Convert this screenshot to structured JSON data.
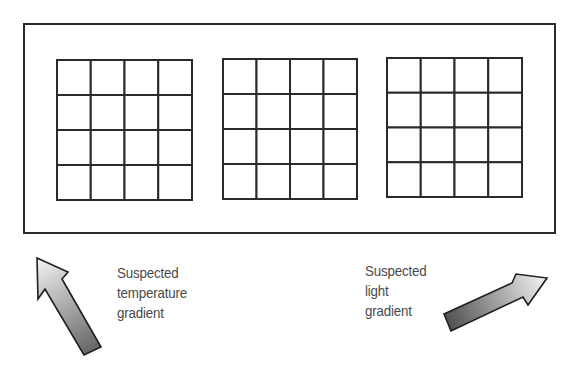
{
  "diagram": {
    "type": "plate-layout",
    "outer_frame": {
      "x": 24,
      "y": 24,
      "width": 531,
      "height": 209
    },
    "plates": [
      {
        "id": "plate-1",
        "x": 57,
        "y": 60,
        "width": 135,
        "height": 140,
        "rows": 4,
        "cols": 4
      },
      {
        "id": "plate-2",
        "x": 223,
        "y": 59,
        "width": 134,
        "height": 140,
        "rows": 4,
        "cols": 4
      },
      {
        "id": "plate-3",
        "x": 387,
        "y": 58,
        "width": 135,
        "height": 139,
        "rows": 4,
        "cols": 4
      }
    ],
    "stroke_color": "#2a2a2a",
    "arrows": [
      {
        "id": "temperature-arrow",
        "direction": "up-left",
        "points": [
          [
            37,
            258
          ],
          [
            68,
            272
          ],
          [
            62,
            279
          ],
          [
            101,
            347
          ],
          [
            84,
            355
          ],
          [
            45,
            289
          ],
          [
            38,
            299
          ]
        ],
        "gradient_start": "#f2f2f2",
        "gradient_end": "#6a6a6a"
      },
      {
        "id": "light-arrow",
        "direction": "up-right",
        "points": [
          [
            444,
            314
          ],
          [
            512,
            283
          ],
          [
            516,
            274
          ],
          [
            547,
            278
          ],
          [
            528,
            305
          ],
          [
            523,
            297
          ],
          [
            451,
            331
          ]
        ],
        "gradient_start": "#555555",
        "gradient_end": "#f2f2f2"
      }
    ]
  },
  "labels": {
    "temperature": {
      "line1": "Suspected",
      "line2": "temperature",
      "line3": "gradient"
    },
    "light": {
      "line1": "Suspected",
      "line2": "light",
      "line3": "gradient"
    }
  }
}
